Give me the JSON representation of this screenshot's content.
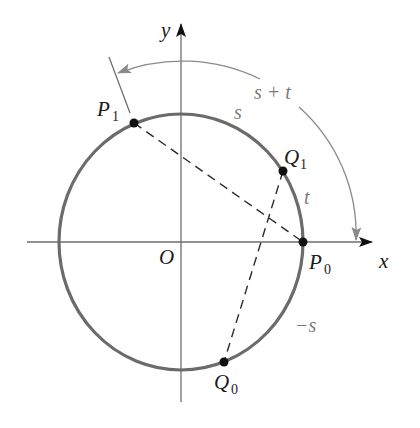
{
  "figure": {
    "axes": {
      "x_label": "x",
      "y_label": "y",
      "origin_label": "O"
    },
    "points": [
      {
        "id": "P0",
        "label_main": "P",
        "label_sub": "0"
      },
      {
        "id": "P1",
        "label_main": "P",
        "label_sub": "1"
      },
      {
        "id": "Q0",
        "label_main": "Q",
        "label_sub": "0"
      },
      {
        "id": "Q1",
        "label_main": "Q",
        "label_sub": "1"
      }
    ],
    "arc_labels": {
      "s": "s",
      "t": "t",
      "s_plus_t": "s + t",
      "minus_s": "−s"
    },
    "segments": [
      {
        "from": "P1",
        "to": "P0",
        "style": "dashed"
      },
      {
        "from": "Q1",
        "to": "Q0",
        "style": "dashed"
      }
    ],
    "colors": {
      "circle": "#6b6b6b",
      "axis": "#6e6e6e",
      "arc_label": "#7a7a7a",
      "point": "#111111"
    }
  }
}
